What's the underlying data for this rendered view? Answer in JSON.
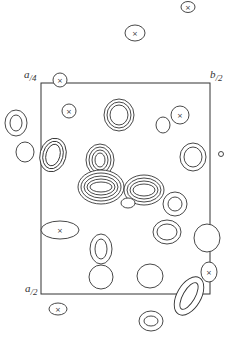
{
  "diagram": {
    "type": "electron-density-contour-map",
    "stroke_color": "#333333",
    "background": "#ffffff",
    "cell": {
      "x": 41,
      "y": 83,
      "width": 169,
      "height": 211
    },
    "labels": {
      "top_left": {
        "num": "a",
        "den": "4"
      },
      "top_right": {
        "num": "b",
        "den": "2"
      },
      "bottom_left": {
        "num": "a",
        "den": "2"
      }
    },
    "contours": [
      {
        "cx": 188,
        "cy": 7,
        "rx": 7,
        "ry": 5.5,
        "rings": 1,
        "cross": true
      },
      {
        "cx": 135,
        "cy": 33,
        "rx": 10,
        "ry": 8,
        "rings": 1,
        "cross": true
      },
      {
        "cx": 60,
        "cy": 80,
        "rx": 7,
        "ry": 7,
        "rings": 1,
        "cross": true
      },
      {
        "cx": 69,
        "cy": 111,
        "rx": 7,
        "ry": 7,
        "rings": 1,
        "cross": true
      },
      {
        "cx": 119,
        "cy": 115,
        "rx": 15,
        "ry": 16,
        "rings": 3,
        "cross": false,
        "gap": 3
      },
      {
        "cx": 180,
        "cy": 115,
        "rx": 9,
        "ry": 9,
        "rings": 1,
        "cross": true
      },
      {
        "cx": 163,
        "cy": 125,
        "rx": 7,
        "ry": 8,
        "rings": 1,
        "cross": false
      },
      {
        "cx": 16,
        "cy": 123,
        "rx": 11,
        "ry": 13,
        "rings": 2,
        "cross": false,
        "gap": 5
      },
      {
        "cx": 25,
        "cy": 152,
        "rx": 9,
        "ry": 10,
        "rings": 1,
        "cross": false
      },
      {
        "cx": 53,
        "cy": 155,
        "rx": 13,
        "ry": 17,
        "rings": 3,
        "cross": false,
        "gap": 3,
        "rot": 15
      },
      {
        "cx": 100,
        "cy": 160,
        "rx": 14,
        "ry": 16,
        "rings": 4,
        "cross": false,
        "gap": 3
      },
      {
        "cx": 193,
        "cy": 157,
        "rx": 13,
        "ry": 14,
        "rings": 2,
        "cross": false,
        "gap": 4
      },
      {
        "cx": 221,
        "cy": 154,
        "rx": 2.5,
        "ry": 2.5,
        "rings": 1,
        "cross": false
      },
      {
        "cx": 101,
        "cy": 187,
        "rx": 23,
        "ry": 17,
        "rings": 5,
        "cross": false,
        "gap": 3
      },
      {
        "cx": 144,
        "cy": 190,
        "rx": 20,
        "ry": 15,
        "rings": 4,
        "cross": false,
        "gap": 3
      },
      {
        "cx": 128,
        "cy": 203,
        "rx": 7,
        "ry": 5,
        "rings": 1,
        "cross": false
      },
      {
        "cx": 175,
        "cy": 204,
        "rx": 12,
        "ry": 12,
        "rings": 2,
        "cross": false,
        "gap": 5
      },
      {
        "cx": 167,
        "cy": 232,
        "rx": 14,
        "ry": 12,
        "rings": 2,
        "cross": false,
        "gap": 4
      },
      {
        "cx": 60,
        "cy": 230,
        "rx": 19,
        "ry": 9,
        "rings": 1,
        "cross": true
      },
      {
        "cx": 101,
        "cy": 249,
        "rx": 11,
        "ry": 15,
        "rings": 2,
        "cross": false,
        "gap": 5
      },
      {
        "cx": 207,
        "cy": 238,
        "rx": 13,
        "ry": 14,
        "rings": 1,
        "cross": false
      },
      {
        "cx": 101,
        "cy": 277,
        "rx": 12,
        "ry": 12,
        "rings": 1,
        "cross": false
      },
      {
        "cx": 150,
        "cy": 276,
        "rx": 13,
        "ry": 12,
        "rings": 1,
        "cross": false
      },
      {
        "cx": 209,
        "cy": 272,
        "rx": 8,
        "ry": 10,
        "rings": 1,
        "cross": true
      },
      {
        "cx": 189,
        "cy": 296,
        "rx": 12,
        "ry": 21,
        "rings": 2,
        "cross": false,
        "gap": 6,
        "rot": 30
      },
      {
        "cx": 58,
        "cy": 309,
        "rx": 9,
        "ry": 6,
        "rings": 1,
        "cross": true
      },
      {
        "cx": 151,
        "cy": 321,
        "rx": 12,
        "ry": 10,
        "rings": 2,
        "cross": false,
        "gap": 5
      }
    ]
  }
}
